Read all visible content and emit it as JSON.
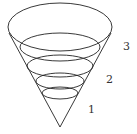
{
  "diagram": {
    "type": "nested cone with horizontal cross-section ellipses",
    "stroke_color": "#222222",
    "apex": {
      "x": 60,
      "y": 127
    },
    "ellipses": [
      {
        "cx": 60,
        "cy": 27,
        "rx": 52,
        "ry": 24
      },
      {
        "cx": 60,
        "cy": 47,
        "rx": 40,
        "ry": 14
      },
      {
        "cx": 60,
        "cy": 66,
        "rx": 33,
        "ry": 11
      },
      {
        "cx": 60,
        "cy": 81,
        "rx": 24,
        "ry": 8
      },
      {
        "cx": 60,
        "cy": 93,
        "rx": 18,
        "ry": 6
      }
    ],
    "labels": [
      {
        "text": "3",
        "x": 123,
        "y": 50
      },
      {
        "text": "2",
        "x": 106,
        "y": 83
      },
      {
        "text": "1",
        "x": 88,
        "y": 113
      }
    ]
  }
}
